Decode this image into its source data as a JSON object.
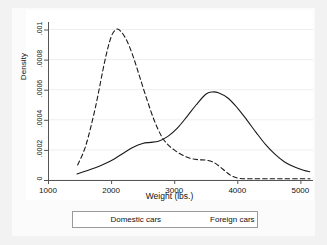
{
  "chart_data": {
    "type": "line",
    "title": "",
    "xlabel": "Weight (lbs.)",
    "ylabel": "Density",
    "xlim": [
      1000,
      5200
    ],
    "ylim": [
      0,
      0.00105
    ],
    "grid": true,
    "legend_position": "bottom-outside",
    "xticks": [
      1000,
      2000,
      3000,
      4000,
      5000
    ],
    "xtick_labels": [
      "1000",
      "2000",
      "3000",
      "4000",
      "5000"
    ],
    "yticks": [
      0,
      0.0002,
      0.0004,
      0.0006,
      0.0008,
      0.001
    ],
    "ytick_labels": [
      "0",
      ".0002",
      ".0004",
      ".0006",
      ".0008",
      ".001"
    ],
    "series": [
      {
        "name": "Domestic cars",
        "style": "solid",
        "color": "#1a1a1a",
        "x": [
          1460,
          1600,
          1750,
          1900,
          2050,
          2200,
          2350,
          2500,
          2620,
          2750,
          2900,
          3050,
          3200,
          3350,
          3500,
          3600,
          3700,
          3850,
          4000,
          4150,
          4300,
          4450,
          4600,
          4750,
          4900,
          5050,
          5150
        ],
        "y": [
          4e-05,
          6e-05,
          8.2e-05,
          0.000108,
          0.00014,
          0.00018,
          0.000218,
          0.000243,
          0.00025,
          0.000258,
          0.00029,
          0.000345,
          0.00042,
          0.0005,
          0.00057,
          0.000585,
          0.00058,
          0.000545,
          0.00048,
          0.0004,
          0.000315,
          0.000235,
          0.00017,
          0.00012,
          8.8e-05,
          6.5e-05,
          5.5e-05
        ]
      },
      {
        "name": "Foreign cars",
        "style": "dashed",
        "color": "#1a1a1a",
        "x": [
          1470,
          1600,
          1750,
          1900,
          2000,
          2080,
          2150,
          2250,
          2350,
          2450,
          2560,
          2680,
          2800,
          2900,
          3000,
          3120,
          3250,
          3380,
          3500,
          3620,
          3720,
          3820,
          3920,
          4050,
          4250,
          4500,
          4800,
          5150
        ],
        "y": [
          0.0001,
          0.00023,
          0.00048,
          0.00079,
          0.00095,
          0.001,
          0.00099,
          0.000925,
          0.00082,
          0.00069,
          0.000545,
          0.0004,
          0.00029,
          0.000235,
          0.0002,
          0.000168,
          0.000145,
          0.000135,
          0.000132,
          0.000118,
          9e-05,
          5.5e-05,
          2.5e-05,
          1e-05,
          8e-06,
          8e-06,
          8e-06,
          8e-06
        ]
      }
    ]
  },
  "legend": {
    "entries": [
      {
        "label": "Domestic cars",
        "style": "solid"
      },
      {
        "label": "Foreign cars",
        "style": "dashed"
      }
    ]
  }
}
